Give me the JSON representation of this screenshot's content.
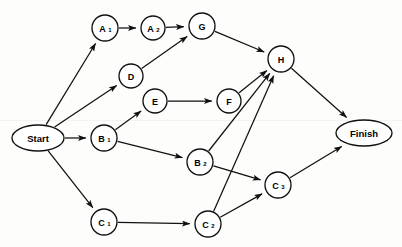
{
  "diagram": {
    "type": "directed-acyclic-graph",
    "width": 402,
    "height": 247,
    "background_color": "#fdfdfc",
    "stroke_color": "#111111",
    "node_fill": "#ffffff",
    "nodes": [
      {
        "id": "Start",
        "label": "Start",
        "base": "Start",
        "sub": "",
        "shape": "ellipse",
        "x": 38,
        "y": 138,
        "rx": 26,
        "ry": 13
      },
      {
        "id": "A1",
        "label": "A1",
        "base": "A",
        "sub": "1",
        "shape": "circle",
        "x": 105,
        "y": 28,
        "rx": 13,
        "ry": 13
      },
      {
        "id": "A2",
        "label": "A2",
        "base": "A",
        "sub": "2",
        "shape": "circle",
        "x": 153,
        "y": 28,
        "rx": 12,
        "ry": 12
      },
      {
        "id": "G",
        "label": "G",
        "base": "G",
        "sub": "",
        "shape": "circle",
        "x": 202,
        "y": 26,
        "rx": 13,
        "ry": 13
      },
      {
        "id": "D",
        "label": "D",
        "base": "D",
        "sub": "",
        "shape": "circle",
        "x": 131,
        "y": 76,
        "rx": 12,
        "ry": 12
      },
      {
        "id": "E",
        "label": "E",
        "base": "E",
        "sub": "",
        "shape": "circle",
        "x": 155,
        "y": 101,
        "rx": 12,
        "ry": 12
      },
      {
        "id": "F",
        "label": "F",
        "base": "F",
        "sub": "",
        "shape": "circle",
        "x": 229,
        "y": 101,
        "rx": 12,
        "ry": 12
      },
      {
        "id": "H",
        "label": "H",
        "base": "H",
        "sub": "",
        "shape": "circle",
        "x": 281,
        "y": 59,
        "rx": 13,
        "ry": 13
      },
      {
        "id": "B1",
        "label": "B1",
        "base": "B",
        "sub": "1",
        "shape": "circle",
        "x": 104,
        "y": 138,
        "rx": 13,
        "ry": 13
      },
      {
        "id": "B2",
        "label": "B2",
        "base": "B",
        "sub": "2",
        "shape": "circle",
        "x": 200,
        "y": 162,
        "rx": 13,
        "ry": 13
      },
      {
        "id": "C1",
        "label": "C1",
        "base": "C",
        "sub": "1",
        "shape": "circle",
        "x": 104,
        "y": 222,
        "rx": 13,
        "ry": 13
      },
      {
        "id": "C2",
        "label": "C2",
        "base": "C",
        "sub": "2",
        "shape": "circle",
        "x": 208,
        "y": 224,
        "rx": 13,
        "ry": 13
      },
      {
        "id": "C3",
        "label": "C3",
        "base": "C",
        "sub": "3",
        "shape": "circle",
        "x": 278,
        "y": 185,
        "rx": 13,
        "ry": 13
      },
      {
        "id": "Finish",
        "label": "Finish",
        "base": "Finish",
        "sub": "",
        "shape": "ellipse",
        "x": 364,
        "y": 133,
        "rx": 28,
        "ry": 13
      }
    ],
    "edges": [
      {
        "from": "Start",
        "to": "A1"
      },
      {
        "from": "Start",
        "to": "D"
      },
      {
        "from": "Start",
        "to": "B1"
      },
      {
        "from": "Start",
        "to": "C1"
      },
      {
        "from": "A1",
        "to": "A2"
      },
      {
        "from": "A2",
        "to": "G"
      },
      {
        "from": "D",
        "to": "G"
      },
      {
        "from": "G",
        "to": "H"
      },
      {
        "from": "E",
        "to": "F"
      },
      {
        "from": "F",
        "to": "H"
      },
      {
        "from": "B1",
        "to": "E"
      },
      {
        "from": "B1",
        "to": "B2"
      },
      {
        "from": "B2",
        "to": "H"
      },
      {
        "from": "B2",
        "to": "C3"
      },
      {
        "from": "C1",
        "to": "C2"
      },
      {
        "from": "C2",
        "to": "H"
      },
      {
        "from": "C2",
        "to": "C3"
      },
      {
        "from": "C3",
        "to": "Finish"
      },
      {
        "from": "H",
        "to": "Finish"
      }
    ]
  }
}
